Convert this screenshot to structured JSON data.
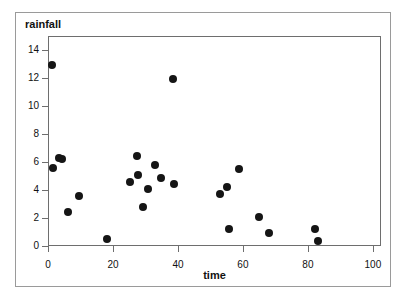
{
  "chart_data": {
    "type": "scatter",
    "title": "",
    "xlabel": "time",
    "ylabel": "rainfall",
    "xlim": [
      0,
      102.5
    ],
    "ylim": [
      0,
      15
    ],
    "xticks": [
      0,
      20,
      40,
      60,
      80,
      100
    ],
    "yticks": [
      0,
      2,
      4,
      6,
      8,
      10,
      12,
      14
    ],
    "xtick_labels": [
      "0",
      "20",
      "40",
      "60",
      "80",
      "100"
    ],
    "ytick_labels": [
      "0",
      "2",
      "4",
      "6",
      "8",
      "10",
      "12",
      "14"
    ],
    "grid": false,
    "legend": null,
    "marker": {
      "shape": "circle",
      "color": "#151515",
      "size": 8
    },
    "points": [
      {
        "x": 1.2,
        "y": 12.9
      },
      {
        "x": 1.5,
        "y": 5.6
      },
      {
        "x": 3.4,
        "y": 6.3
      },
      {
        "x": 4.3,
        "y": 6.2
      },
      {
        "x": 6.2,
        "y": 2.45
      },
      {
        "x": 9.5,
        "y": 3.6
      },
      {
        "x": 18.2,
        "y": 0.5
      },
      {
        "x": 25.2,
        "y": 4.6
      },
      {
        "x": 27.5,
        "y": 6.4
      },
      {
        "x": 27.8,
        "y": 5.05
      },
      {
        "x": 29.2,
        "y": 2.8
      },
      {
        "x": 30.8,
        "y": 4.05
      },
      {
        "x": 33.0,
        "y": 5.8
      },
      {
        "x": 34.8,
        "y": 4.85
      },
      {
        "x": 38.4,
        "y": 11.9
      },
      {
        "x": 38.8,
        "y": 4.45
      },
      {
        "x": 53.0,
        "y": 3.7
      },
      {
        "x": 55.2,
        "y": 4.25
      },
      {
        "x": 55.6,
        "y": 1.2
      },
      {
        "x": 58.9,
        "y": 5.5
      },
      {
        "x": 64.8,
        "y": 2.05
      },
      {
        "x": 68.1,
        "y": 0.9
      },
      {
        "x": 82.3,
        "y": 1.2
      },
      {
        "x": 83.0,
        "y": 0.35
      }
    ]
  },
  "colors": {
    "marker": "#151515",
    "axis": "#6e6e6e",
    "outer_border": "#9a9a9a",
    "text": "#111111",
    "background": "#ffffff"
  }
}
